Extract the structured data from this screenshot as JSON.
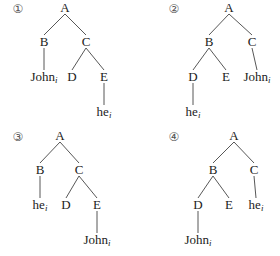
{
  "figure": {
    "trees": [
      {
        "number": "①",
        "nodes": {
          "A": {
            "label": "A"
          },
          "B": {
            "label": "B"
          },
          "C": {
            "label": "C"
          },
          "D": {
            "label": "D"
          },
          "E": {
            "label": "E"
          },
          "L1": {
            "label": "John",
            "index": "i"
          },
          "L2": {
            "label": "he",
            "index": "i"
          }
        },
        "edges": [
          [
            "A",
            "B"
          ],
          [
            "A",
            "C"
          ],
          [
            "B",
            "L1"
          ],
          [
            "C",
            "D"
          ],
          [
            "C",
            "E"
          ],
          [
            "E",
            "L2"
          ]
        ]
      },
      {
        "number": "②",
        "nodes": {
          "A": {
            "label": "A"
          },
          "B": {
            "label": "B"
          },
          "C": {
            "label": "C"
          },
          "D": {
            "label": "D"
          },
          "E": {
            "label": "E"
          },
          "L1": {
            "label": "John",
            "index": "i"
          },
          "L2": {
            "label": "he",
            "index": "i"
          }
        },
        "edges": [
          [
            "A",
            "B"
          ],
          [
            "A",
            "C"
          ],
          [
            "B",
            "D"
          ],
          [
            "B",
            "E"
          ],
          [
            "C",
            "L1"
          ],
          [
            "D",
            "L2"
          ]
        ]
      },
      {
        "number": "③",
        "nodes": {
          "A": {
            "label": "A"
          },
          "B": {
            "label": "B"
          },
          "C": {
            "label": "C"
          },
          "D": {
            "label": "D"
          },
          "E": {
            "label": "E"
          },
          "L1": {
            "label": "he",
            "index": "i"
          },
          "L2": {
            "label": "John",
            "index": "i"
          }
        },
        "edges": [
          [
            "A",
            "B"
          ],
          [
            "A",
            "C"
          ],
          [
            "B",
            "L1"
          ],
          [
            "C",
            "D"
          ],
          [
            "C",
            "E"
          ],
          [
            "E",
            "L2"
          ]
        ]
      },
      {
        "number": "④",
        "nodes": {
          "A": {
            "label": "A"
          },
          "B": {
            "label": "B"
          },
          "C": {
            "label": "C"
          },
          "D": {
            "label": "D"
          },
          "E": {
            "label": "E"
          },
          "L1": {
            "label": "he",
            "index": "i"
          },
          "L2": {
            "label": "John",
            "index": "i"
          }
        },
        "edges": [
          [
            "A",
            "B"
          ],
          [
            "A",
            "C"
          ],
          [
            "B",
            "D"
          ],
          [
            "B",
            "E"
          ],
          [
            "C",
            "L1"
          ],
          [
            "D",
            "L2"
          ]
        ]
      }
    ]
  }
}
